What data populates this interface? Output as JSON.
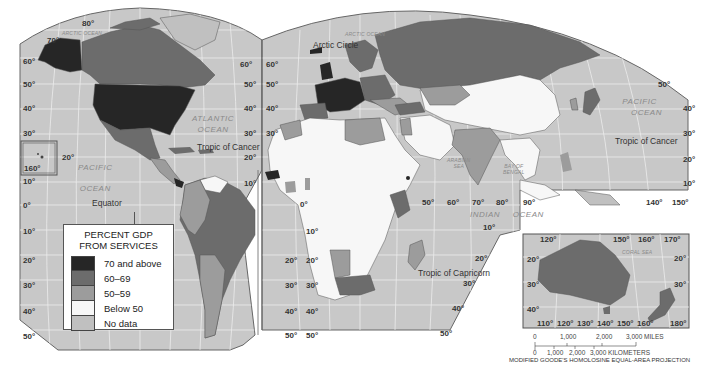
{
  "map": {
    "title": "PERCENT GDP FROM SERVICES",
    "projection": "MODIFIED GOODE'S HOMOLOSINE EQUAL-AREA PROJECTION",
    "colors": {
      "ocean": "#c8c8c8",
      "graticule": "#ececec",
      "border": "#555555",
      "70_and_above": "#262626",
      "60_69": "#6c6c6c",
      "50_59": "#9c9c9c",
      "below_50": "#f7f7f7",
      "no_data": "#c0c0c0"
    },
    "legend": {
      "title_line1": "PERCENT GDP",
      "title_line2": "FROM SERVICES",
      "items": [
        {
          "label": "70 and above",
          "color": "#262626"
        },
        {
          "label": "60–69",
          "color": "#6c6c6c"
        },
        {
          "label": "50–59",
          "color": "#9c9c9c"
        },
        {
          "label": "Below 50",
          "color": "#f7f7f7"
        },
        {
          "label": "No data",
          "color": "#c0c0c0"
        }
      ]
    },
    "oceans": {
      "arctic_left": "ARCTIC OCEAN",
      "arctic_right": "ARCTIC OCEAN",
      "atlantic_1": "ATLANTIC",
      "atlantic_2": "OCEAN",
      "pacific_left_1": "PACIFIC",
      "pacific_left_2": "OCEAN",
      "pacific_right_1": "PACIFIC",
      "pacific_right_2": "OCEAN",
      "indian_1": "INDIAN",
      "indian_2": "OCEAN",
      "arabian_1": "ARABIAN",
      "arabian_2": "SEA",
      "bengal_1": "BAY OF",
      "bengal_2": "BENGAL",
      "coral": "CORAL SEA"
    },
    "lines": {
      "arctic_circle": "Arctic Circle",
      "tropic_cancer_left": "Tropic of Cancer",
      "tropic_cancer_right": "Tropic of Cancer",
      "equator": "Equator",
      "tropic_capricorn": "Tropic of Capricorn"
    },
    "lat_labels_left": [
      "80°",
      "70°",
      "60°",
      "50°",
      "40°",
      "30°",
      "20°",
      "10°",
      "0°",
      "10°",
      "20°",
      "30°",
      "40°",
      "50°"
    ],
    "hawaii_label": "160°",
    "lat_labels_mid_left": [
      "60°",
      "50°",
      "40°",
      "30°",
      "20°",
      "10°"
    ],
    "lat_labels_mid_right": [
      "60°",
      "50°",
      "40°",
      "30°",
      "20°",
      "10°",
      "0°",
      "10°",
      "20°",
      "30°",
      "40°",
      "50°"
    ],
    "lat_labels_africa": [
      "10°",
      "20°",
      "30°",
      "40°",
      "50°"
    ],
    "lat_labels_africa_right": [
      "20°",
      "30°",
      "40°",
      "50°"
    ],
    "lon_labels_indian": [
      "50°",
      "60°",
      "70°",
      "80°",
      "90°"
    ],
    "indian_lat": "10°",
    "lat_labels_right": [
      "50°",
      "40°",
      "30°",
      "20°",
      "10°"
    ],
    "lon_labels_pacific": [
      "140°",
      "150°"
    ],
    "australia_inset": {
      "top_lon": [
        "120°",
        "150°",
        "160°",
        "170°"
      ],
      "bottom_lon": [
        "110°",
        "120°",
        "130°",
        "140°",
        "150°",
        "160°",
        "180°"
      ],
      "left_lat": [
        "20°",
        "30°",
        "40°"
      ],
      "right_lat": [
        "20°",
        "30°"
      ]
    },
    "scale": {
      "miles_ticks": [
        "0",
        "1,000",
        "2,000",
        "3,000 MILES"
      ],
      "km_ticks": [
        "0",
        "1,000",
        "2,000",
        "3,000 KILOMETERS"
      ]
    },
    "zero_lon": "0°"
  }
}
